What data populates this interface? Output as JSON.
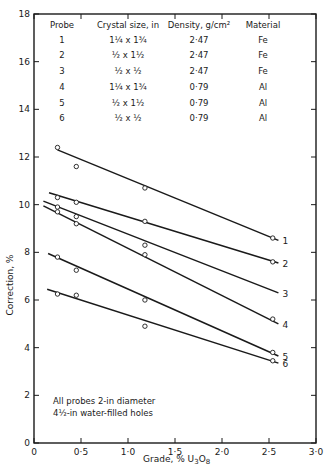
{
  "chart_data": {
    "type": "line",
    "title": "",
    "xlabel": "Grade, % U3O8",
    "ylabel": "Correction, %",
    "xlim": [
      0,
      3.0
    ],
    "ylim": [
      0,
      18
    ],
    "x_ticks": [
      "0",
      "0·5",
      "1·0",
      "1·5",
      "2·0",
      "2·5",
      "3·0"
    ],
    "y_ticks": [
      "0",
      "2",
      "4",
      "6",
      "8",
      "10",
      "12",
      "14",
      "16",
      "18"
    ],
    "grid": false,
    "legend_position": "inline-right",
    "series": [
      {
        "name": "1",
        "points": [
          [
            0.25,
            12.4
          ],
          [
            0.45,
            11.6
          ],
          [
            1.18,
            10.7
          ],
          [
            2.54,
            8.6
          ]
        ],
        "fit_line": [
          [
            0.25,
            12.3
          ],
          [
            2.6,
            8.5
          ]
        ]
      },
      {
        "name": "2",
        "points": [
          [
            0.25,
            10.3
          ],
          [
            0.45,
            10.1
          ],
          [
            1.18,
            9.3
          ],
          [
            2.54,
            7.6
          ]
        ],
        "fit_line": [
          [
            0.16,
            10.5
          ],
          [
            2.6,
            7.55
          ]
        ]
      },
      {
        "name": "3",
        "points": [
          [
            0.25,
            9.9
          ],
          [
            0.45,
            9.5
          ],
          [
            1.18,
            8.3
          ]
        ],
        "fit_line": [
          [
            0.1,
            10.15
          ],
          [
            2.6,
            6.3
          ]
        ]
      },
      {
        "name": "4",
        "points": [
          [
            0.25,
            9.7
          ],
          [
            0.45,
            9.2
          ],
          [
            1.18,
            7.9
          ],
          [
            2.54,
            5.2
          ]
        ],
        "fit_line": [
          [
            0.1,
            9.95
          ],
          [
            2.6,
            5.0
          ]
        ]
      },
      {
        "name": "5",
        "points": [
          [
            0.25,
            7.8
          ],
          [
            0.45,
            7.25
          ],
          [
            1.18,
            6.0
          ],
          [
            2.54,
            3.8
          ]
        ],
        "fit_line": [
          [
            0.15,
            7.95
          ],
          [
            2.6,
            3.65
          ]
        ]
      },
      {
        "name": "6",
        "points": [
          [
            0.25,
            6.25
          ],
          [
            0.45,
            6.2
          ],
          [
            1.18,
            4.9
          ],
          [
            2.54,
            3.45
          ]
        ],
        "fit_line": [
          [
            0.14,
            6.45
          ],
          [
            2.6,
            3.35
          ]
        ]
      }
    ],
    "annotations": [
      "All probes 2-in diameter",
      "4½-in water-filled holes"
    ]
  },
  "table": {
    "headers": [
      "Probe",
      "Crystal size, in",
      "Density, g/cm²",
      "Material"
    ],
    "rows": [
      {
        "probe": "1",
        "size": "1¼ x 1¾",
        "density": "2·47",
        "material": "Fe"
      },
      {
        "probe": "2",
        "size": "½ x 1½",
        "density": "2·47",
        "material": "Fe"
      },
      {
        "probe": "3",
        "size": "½ x ½",
        "density": "2·47",
        "material": "Fe"
      },
      {
        "probe": "4",
        "size": "1¼ x 1¾",
        "density": "0·79",
        "material": "Al"
      },
      {
        "probe": "5",
        "size": "½ x 1½",
        "density": "0·79",
        "material": "Al"
      },
      {
        "probe": "6",
        "size": "½ x ½",
        "density": "0·79",
        "material": "Al"
      }
    ]
  },
  "note": {
    "line1": "All probes 2-in diameter",
    "line2": "4½-in water-filled holes"
  },
  "axes": {
    "x_title": "Grade, % U",
    "x_title_sub1": "3",
    "x_title_mid": "O",
    "x_title_sub2": "8",
    "y_title": "Correction, %"
  },
  "colors": {
    "ink": "#1a1a1a",
    "background": "#ffffff"
  }
}
